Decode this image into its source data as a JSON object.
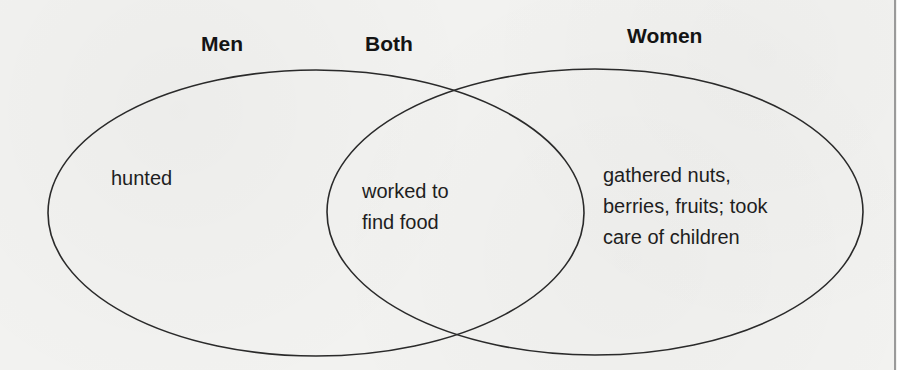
{
  "diagram": {
    "type": "venn",
    "headings": {
      "left": "Men",
      "center": "Both",
      "right": "Women"
    },
    "regions": {
      "left_only": {
        "lines": [
          "hunted"
        ]
      },
      "overlap": {
        "lines": [
          "worked to",
          "find food"
        ]
      },
      "right_only": {
        "lines": [
          "gathered nuts,",
          "berries, fruits; took",
          "care of children"
        ]
      }
    },
    "shapes": {
      "left_ellipse": {
        "cx": 316,
        "cy": 213,
        "rx": 268,
        "ry": 143
      },
      "right_ellipse": {
        "cx": 595,
        "cy": 212,
        "rx": 268,
        "ry": 143
      }
    },
    "colors": {
      "background": "#f2f2f0",
      "stroke": "#2a2a2a",
      "text": "#1e1e1e"
    }
  }
}
